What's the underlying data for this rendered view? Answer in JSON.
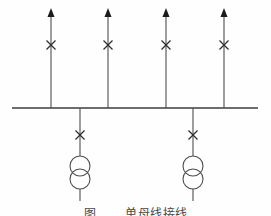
{
  "diagram": {
    "type": "single-busbar-electrical-one-line-scheme",
    "canvas": {
      "width": 271,
      "height": 216,
      "background": "#fefefe"
    },
    "colors": {
      "feeder_line": "#4d4d4d",
      "bus_line": "#3c3c3c",
      "arrowhead": "#1c1c1c",
      "breaker_cross": "#2e2e2e",
      "transformer_stroke": "#4d4d4d",
      "caption_text": "#4a4a4a"
    },
    "bus": {
      "y": 108,
      "x1": 12,
      "x2": 258,
      "stroke_width": 1.6
    },
    "outgoing_feeders": {
      "count": 4,
      "xs": [
        51,
        108,
        166,
        224
      ],
      "arrow_tip_y": 8,
      "arrow_base_y": 17,
      "arrow_half_width": 3.5,
      "line_top_y": 14,
      "cross_y": 45,
      "cross_arm": 4.5
    },
    "transformer_branches": {
      "count": 2,
      "xs": [
        80,
        193
      ],
      "cross_y": 135,
      "cross_arm": 4.5,
      "circle_radius": 10,
      "circle_top_cy": 166,
      "circle_bottom_cy": 179,
      "tail_end_y": 201
    },
    "caption": {
      "prefix": "图",
      "title": "单母线接线"
    }
  }
}
